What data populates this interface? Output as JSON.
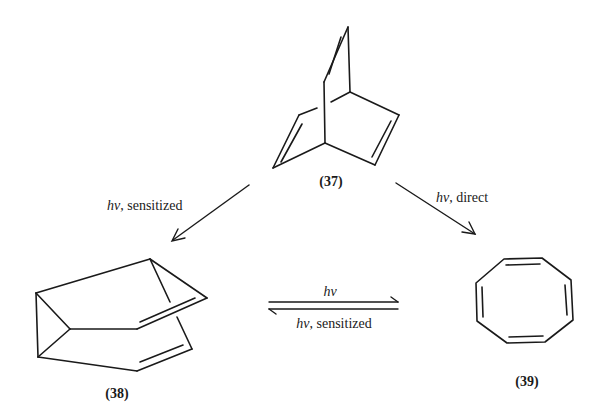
{
  "diagram": {
    "type": "reaction-scheme",
    "colors": {
      "ink": "#1a1a1a",
      "background": "#ffffff"
    },
    "compounds": [
      {
        "id": "37",
        "label": "(37)",
        "name": "bicyclo[2.2.2]octatriene (barrelene)"
      },
      {
        "id": "38",
        "label": "(38)",
        "name": "semibullvalene"
      },
      {
        "id": "39",
        "label": "(39)",
        "name": "cyclooctatetraene"
      }
    ],
    "arrows": [
      {
        "from": "37",
        "to": "38",
        "hv": "hν",
        "condition": ", sensitized"
      },
      {
        "from": "37",
        "to": "39",
        "hv": "hν",
        "condition": ", direct"
      },
      {
        "from": "38",
        "to": "39",
        "hv": "hν",
        "condition": "",
        "direction": "forward"
      },
      {
        "from": "39",
        "to": "38",
        "hv": "hν",
        "condition": ", sensitized",
        "direction": "reverse"
      }
    ]
  }
}
